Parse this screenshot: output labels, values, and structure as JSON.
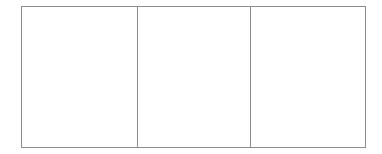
{
  "diagram": {
    "type": "three-panel grid",
    "border_color": "#8c8c8c",
    "background": "#ffffff",
    "cells": [
      {
        "label": ""
      },
      {
        "label": ""
      },
      {
        "label": ""
      }
    ]
  }
}
